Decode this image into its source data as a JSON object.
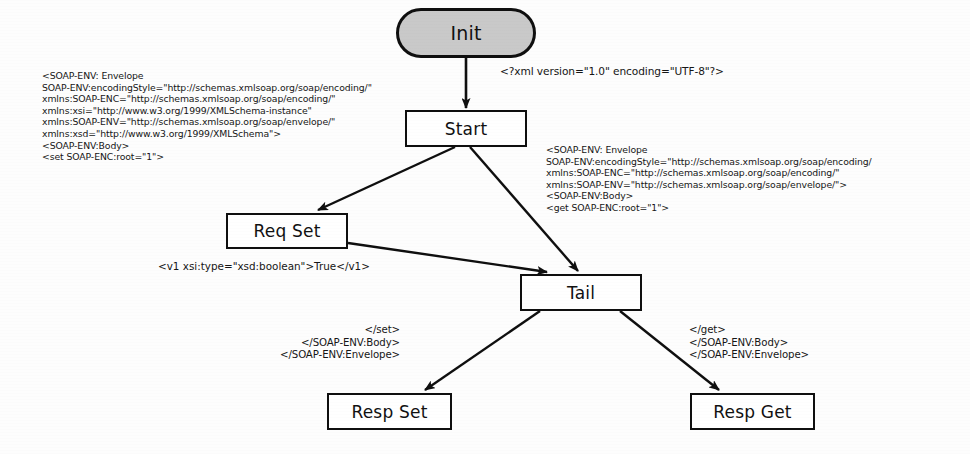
{
  "diagram": {
    "stroke_color": "#0f0f0f",
    "init_fill_color": "#c9c9c9",
    "node_fill_color": "#ffffff",
    "text_color": "#161616",
    "nodes": [
      {
        "id": "init",
        "label": "Init",
        "shape": "stadium",
        "x": 396,
        "y": 8,
        "w": 140,
        "h": 50,
        "font_size": 19
      },
      {
        "id": "start",
        "label": "Start",
        "shape": "rectangle",
        "x": 405,
        "y": 110,
        "w": 122,
        "h": 37,
        "font_size": 17
      },
      {
        "id": "reqset",
        "label": "Req Set",
        "shape": "rectangle",
        "x": 226,
        "y": 213,
        "w": 122,
        "h": 36,
        "font_size": 17
      },
      {
        "id": "tail",
        "label": "Tail",
        "shape": "rectangle",
        "x": 520,
        "y": 274,
        "w": 122,
        "h": 37,
        "font_size": 17
      },
      {
        "id": "respset",
        "label": "Resp Set",
        "shape": "rectangle",
        "x": 327,
        "y": 393,
        "w": 125,
        "h": 37,
        "font_size": 17
      },
      {
        "id": "respget",
        "label": "Resp Get",
        "shape": "rectangle",
        "x": 690,
        "y": 393,
        "w": 125,
        "h": 37,
        "font_size": 17
      }
    ],
    "edges": [
      {
        "id": "init-start",
        "from": "init",
        "to": "start",
        "x1": 466,
        "y1": 58,
        "x2": 466,
        "y2": 108
      },
      {
        "id": "start-reqset",
        "from": "start",
        "to": "reqset",
        "x1": 455,
        "y1": 147,
        "x2": 316,
        "y2": 211
      },
      {
        "id": "start-tail",
        "from": "start",
        "to": "tail",
        "x1": 470,
        "y1": 147,
        "x2": 578,
        "y2": 272
      },
      {
        "id": "reqset-tail",
        "from": "reqset",
        "to": "tail",
        "x1": 348,
        "y1": 243,
        "x2": 545,
        "y2": 272
      },
      {
        "id": "tail-respset",
        "from": "tail",
        "to": "respset",
        "x1": 540,
        "y1": 311,
        "x2": 424,
        "y2": 391
      },
      {
        "id": "tail-respget",
        "from": "tail",
        "to": "respget",
        "x1": 620,
        "y1": 311,
        "x2": 718,
        "y2": 391
      }
    ],
    "annotations": [
      {
        "id": "xml-declaration",
        "align": "left",
        "x": 500,
        "y": 65,
        "lines": [
          "<?xml version=\"1.0\" encoding=\"UTF-8\"?>"
        ],
        "font_size": 10.6
      },
      {
        "id": "soap-set-request",
        "align": "left",
        "x": 42,
        "y": 70,
        "lines": [
          "<SOAP-ENV: Envelope",
          "SOAP-ENV:encodingStyle=\"http://schemas.xmlsoap.org/soap/encoding/\"",
          "xmlns:SOAP-ENC=\"http://schemas.xmlsoap.org/soap/encoding/\"",
          "xmlns:xsi=\"http://www.w3.org/1999/XMLSchema-instance\"",
          "xmlns:SOAP-ENV=\"http://schemas.xmlsoap.org/soap/envelope/\"",
          "xmlns:xsd=\"http://www.w3.org/1999/XMLSchema\">",
          "<SOAP-ENV:Body>",
          "<set SOAP-ENC:root=\"1\">"
        ],
        "font_size": 9.3
      },
      {
        "id": "soap-get-request",
        "align": "left",
        "x": 546,
        "y": 144,
        "lines": [
          "<SOAP-ENV: Envelope",
          "SOAP-ENV:encodingStyle=\"http://schemas.xmlsoap.org/soap/encoding/",
          "xmlns:SOAP-ENC=\"http://schemas.xmlsoap.org/soap/encoding/\"",
          "xmlns:SOAP-ENV=\"http://schemas.xmlsoap.org/soap/envelope/\">",
          "<SOAP-ENV:Body>",
          "<get SOAP-ENC:root=\"1\">"
        ],
        "font_size": 9.3
      },
      {
        "id": "boolean-value-param",
        "align": "left",
        "x": 158,
        "y": 260,
        "lines": [
          "<v1 xsi:type=\"xsd:boolean\">True</v1>"
        ],
        "font_size": 10.4
      },
      {
        "id": "soap-set-close",
        "align": "right",
        "x": 215,
        "y": 324,
        "width": 185,
        "lines": [
          "</set>",
          "</SOAP-ENV:Body>",
          "</SOAP-ENV:Envelope>"
        ],
        "font_size": 10.2
      },
      {
        "id": "soap-get-close",
        "align": "left",
        "x": 689,
        "y": 324,
        "lines": [
          "</get>",
          "</SOAP-ENV:Body>",
          "</SOAP-ENV:Envelope>"
        ],
        "font_size": 10.2
      }
    ]
  }
}
